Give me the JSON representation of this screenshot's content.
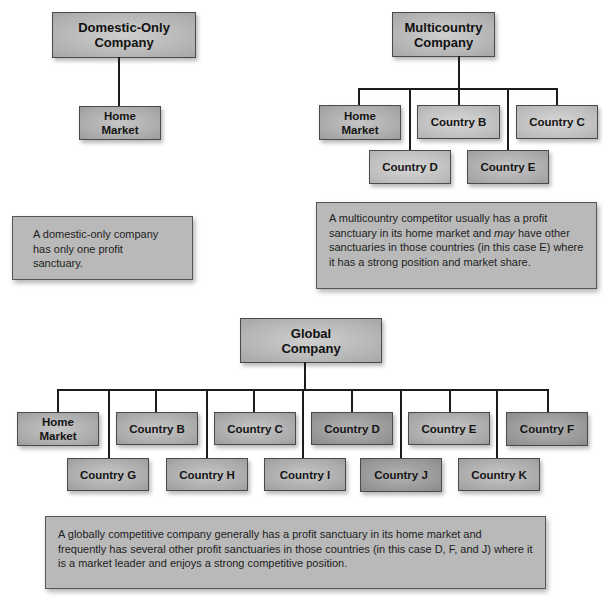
{
  "domestic": {
    "title_line1": "Domestic-Only",
    "title_line2": "Company",
    "children": [
      {
        "line1": "Home",
        "line2": "Market"
      }
    ],
    "note": "A domestic-only company has only one profit sanctuary."
  },
  "multicountry": {
    "title_line1": "Multicountry",
    "title_line2": "Company",
    "children": [
      {
        "line1": "Home",
        "line2": "Market",
        "row": 1
      },
      {
        "label": "Country B",
        "row": 1
      },
      {
        "label": "Country C",
        "row": 1
      },
      {
        "label": "Country D",
        "row": 2
      },
      {
        "label": "Country E",
        "row": 2
      }
    ],
    "note_part1": "A multicountry competitor usually has a profit sanctuary in its home market and ",
    "note_em": "may",
    "note_part2": " have other sanctuaries in those countries (in this case E) where it has a strong position and market share."
  },
  "global": {
    "title_line1": "Global",
    "title_line2": "Company",
    "children": [
      {
        "line1": "Home",
        "line2": "Market",
        "row": 1
      },
      {
        "label": "Country B",
        "row": 1
      },
      {
        "label": "Country C",
        "row": 1
      },
      {
        "label": "Country D",
        "row": 1
      },
      {
        "label": "Country E",
        "row": 1
      },
      {
        "label": "Country F",
        "row": 1
      },
      {
        "label": "Country G",
        "row": 2
      },
      {
        "label": "Country H",
        "row": 2
      },
      {
        "label": "Country I",
        "row": 2
      },
      {
        "label": "Country J",
        "row": 2
      },
      {
        "label": "Country K",
        "row": 2
      }
    ],
    "note": "A globally competitive company generally has a profit sanctuary in its home market and frequently has several other profit sanctuaries in those countries (in this case D, F, and J) where it is a market leader and enjoys a strong competitive position."
  },
  "colors": {
    "box_fill": "#b4b4b4",
    "box_border": "#4a4a4a",
    "connector": "#1c1c1c",
    "note_fill": "#b9b9b9"
  }
}
